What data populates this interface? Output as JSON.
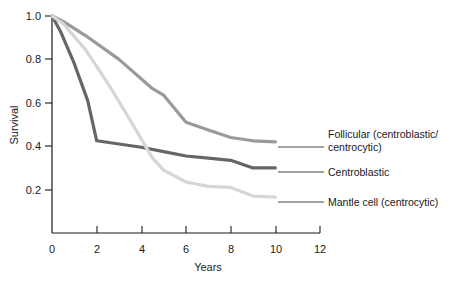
{
  "chart_data": {
    "type": "line",
    "title": "",
    "xlabel": "Years",
    "ylabel": "Survival",
    "xlim": [
      0,
      12
    ],
    "ylim": [
      0,
      1.0
    ],
    "grid": false,
    "legend_position": "right-inline-labels",
    "x_ticks": [
      "0",
      "2",
      "4",
      "6",
      "8",
      "10",
      "12"
    ],
    "x_tick_values": [
      0,
      2,
      4,
      6,
      8,
      10,
      12
    ],
    "y_ticks": [
      "0.2",
      "0.4",
      "0.6",
      "0.8",
      "1.0"
    ],
    "y_tick_values": [
      0.2,
      0.4,
      0.6,
      0.8,
      1.0
    ],
    "series": [
      {
        "name": "Follicular (centroblastic/centrocytic)",
        "label_line1": "Follicular (centroblastic/",
        "label_line2": "centrocytic)",
        "color": "#9a9a9a",
        "x": [
          0,
          0.5,
          1.5,
          3.0,
          4.5,
          5.0,
          6.0,
          7.0,
          8.0,
          9.0,
          10.0
        ],
        "y": [
          1.0,
          0.975,
          0.91,
          0.8,
          0.665,
          0.635,
          0.51,
          0.475,
          0.44,
          0.425,
          0.42
        ]
      },
      {
        "name": "Centroblastic",
        "label_line1": "Centroblastic",
        "label_line2": "",
        "color": "#666666",
        "x": [
          0,
          0.4,
          1.0,
          1.6,
          2.0,
          3.0,
          4.0,
          5.0,
          6.0,
          7.0,
          8.0,
          9.0,
          10.0
        ],
        "y": [
          1.0,
          0.925,
          0.78,
          0.61,
          0.425,
          0.41,
          0.395,
          0.375,
          0.355,
          0.345,
          0.335,
          0.3,
          0.3
        ]
      },
      {
        "name": "Mantle cell (centrocytic)",
        "label_line1": "Mantle cell (centrocytic)",
        "label_line2": "",
        "color": "#d6d6d6",
        "x": [
          0,
          0.5,
          1.5,
          2.5,
          3.5,
          4.5,
          5.0,
          6.0,
          7.0,
          8.0,
          9.0,
          10.0
        ],
        "y": [
          1.0,
          0.965,
          0.845,
          0.69,
          0.52,
          0.345,
          0.29,
          0.235,
          0.215,
          0.21,
          0.17,
          0.165
        ]
      }
    ]
  },
  "axis": {
    "x_title": "Years",
    "y_title": "Survival"
  }
}
